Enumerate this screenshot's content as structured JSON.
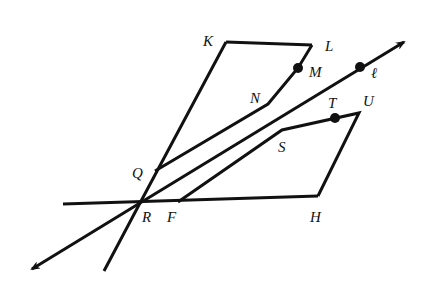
{
  "diagram": {
    "type": "geometry",
    "labels": {
      "K": "K",
      "L": "L",
      "M": "M",
      "N": "N",
      "ell": "ℓ",
      "T": "T",
      "U": "U",
      "S": "S",
      "Q": "Q",
      "R": "R",
      "F": "F",
      "H": "H"
    },
    "points": {
      "K": [
        226,
        42
      ],
      "L": [
        312,
        45
      ],
      "M": [
        298,
        68
      ],
      "N": [
        268,
        104
      ],
      "Q": [
        155,
        171
      ],
      "R": [
        140,
        203
      ],
      "F": [
        178,
        202
      ],
      "H": [
        318,
        196
      ],
      "S": [
        282,
        130
      ],
      "T": [
        335,
        118
      ],
      "U": [
        359,
        113
      ],
      "ell_point": [
        360,
        67
      ]
    },
    "colors": {
      "ink": "#111111",
      "background": "#ffffff"
    }
  }
}
